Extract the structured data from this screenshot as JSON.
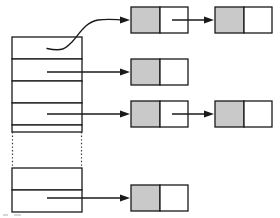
{
  "diagram": {
    "type": "data-structure-diagram",
    "colors": {
      "stroke": "#1a1a1a",
      "key_cell_fill": "#c9c9c9",
      "next_cell_fill": "#ffffff",
      "background": "#ffffff",
      "ellipsis_stroke": "#3a3a3a"
    }
  },
  "bucket_array": {
    "label": "",
    "x": 12,
    "width": 70,
    "top": 37,
    "row_height": 22,
    "rows": [
      {
        "index": 0,
        "label": "",
        "y": 37,
        "has_pointer": true,
        "pointer_style": "curve"
      },
      {
        "index": 1,
        "label": "",
        "y": 59,
        "has_pointer": true,
        "pointer_style": "straight"
      },
      {
        "index": 2,
        "label": "",
        "y": 81,
        "has_pointer": false,
        "pointer_style": "none"
      },
      {
        "index": 3,
        "label": "",
        "y": 103,
        "has_pointer": true,
        "pointer_style": "straight"
      },
      {
        "index": 4,
        "label": "",
        "y": 125,
        "has_pointer": false,
        "pointer_style": "none"
      },
      {
        "index": 5,
        "label": "",
        "y": 169,
        "has_pointer": false,
        "pointer_style": "none"
      },
      {
        "index": 6,
        "label": "",
        "y": 191,
        "has_pointer": true,
        "pointer_style": "straight"
      }
    ],
    "ellipsis": {
      "label": "",
      "top": 132,
      "bottom": 168,
      "style": "dotted-vertical"
    }
  },
  "chains": [
    {
      "bucket_index": 0,
      "nodes": [
        {
          "label": "",
          "key_label": "",
          "next_label": "",
          "x": 131,
          "y": 7,
          "width": 57,
          "height": 26,
          "has_next_link": true
        },
        {
          "label": "",
          "key_label": "",
          "next_label": "",
          "x": 215,
          "y": 7,
          "width": 57,
          "height": 26,
          "has_next_link": false
        }
      ]
    },
    {
      "bucket_index": 1,
      "nodes": [
        {
          "label": "",
          "key_label": "",
          "next_label": "",
          "x": 131,
          "y": 59,
          "width": 57,
          "height": 26,
          "has_next_link": false
        }
      ]
    },
    {
      "bucket_index": 3,
      "nodes": [
        {
          "label": "",
          "key_label": "",
          "next_label": "",
          "x": 131,
          "y": 101,
          "width": 57,
          "height": 26,
          "has_next_link": true
        },
        {
          "label": "",
          "key_label": "",
          "next_label": "",
          "x": 215,
          "y": 101,
          "width": 57,
          "height": 26,
          "has_next_link": false
        }
      ]
    },
    {
      "bucket_index": 6,
      "nodes": [
        {
          "label": "",
          "key_label": "",
          "next_label": "",
          "x": 131,
          "y": 185,
          "width": 57,
          "height": 26,
          "has_next_link": false
        }
      ]
    }
  ],
  "caption": ""
}
